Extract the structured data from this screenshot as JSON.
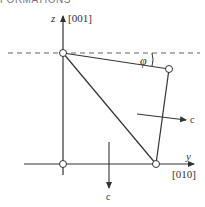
{
  "header": {
    "text": "FORMATIONS"
  },
  "diagram": {
    "axes": {
      "vertical": {
        "symbol": "z",
        "direction": "[001]"
      },
      "horizontal": {
        "symbol": "y",
        "direction": "[010]"
      }
    },
    "angle_label": "φ",
    "force_labels": {
      "right": "c",
      "down": "c"
    },
    "vertices": [
      {
        "name": "top-left",
        "x": 63,
        "y": 53
      },
      {
        "name": "top-right",
        "x": 169,
        "y": 69
      },
      {
        "name": "bottom-right",
        "x": 156,
        "y": 164
      },
      {
        "name": "bottom-left",
        "x": 63,
        "y": 164
      }
    ],
    "colors": {
      "line": "#333333",
      "dash": "#666666"
    }
  }
}
